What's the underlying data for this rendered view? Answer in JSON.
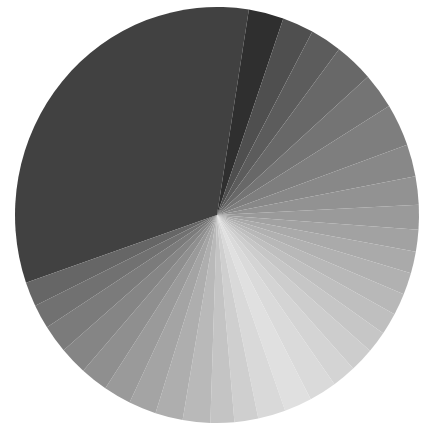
{
  "chart_data": {
    "type": "pie",
    "title": "",
    "legend": "none",
    "start_angle_deg": 251,
    "direction": "clockwise",
    "center": [
      217,
      215
    ],
    "radius": [
      202,
      208
    ],
    "slices": [
      {
        "label": "",
        "value": 32.8,
        "color": "#414141"
      },
      {
        "label": "",
        "value": 2.8,
        "color": "#2f2f2f"
      },
      {
        "label": "",
        "value": 2.5,
        "color": "#4f4f4f"
      },
      {
        "label": "",
        "value": 2.5,
        "color": "#5c5c5c"
      },
      {
        "label": "",
        "value": 3.1,
        "color": "#686868"
      },
      {
        "label": "",
        "value": 2.8,
        "color": "#747474"
      },
      {
        "label": "",
        "value": 3.3,
        "color": "#7e7e7e"
      },
      {
        "label": "",
        "value": 2.5,
        "color": "#888888"
      },
      {
        "label": "",
        "value": 2.2,
        "color": "#929292"
      },
      {
        "label": "",
        "value": 1.9,
        "color": "#9a9a9a"
      },
      {
        "label": "",
        "value": 1.7,
        "color": "#a2a2a2"
      },
      {
        "label": "",
        "value": 1.7,
        "color": "#aaaaaa"
      },
      {
        "label": "",
        "value": 1.7,
        "color": "#b1b1b1"
      },
      {
        "label": "",
        "value": 1.7,
        "color": "#b8b8b8"
      },
      {
        "label": "",
        "value": 1.7,
        "color": "#bfbfbf"
      },
      {
        "label": "",
        "value": 1.7,
        "color": "#c6c6c6"
      },
      {
        "label": "",
        "value": 1.9,
        "color": "#cdcdcd"
      },
      {
        "label": "",
        "value": 1.9,
        "color": "#d4d4d4"
      },
      {
        "label": "",
        "value": 2.2,
        "color": "#dadada"
      },
      {
        "label": "",
        "value": 2.2,
        "color": "#e0e0e0"
      },
      {
        "label": "",
        "value": 2.2,
        "color": "#d9d9d9"
      },
      {
        "label": "",
        "value": 1.9,
        "color": "#cfcfcf"
      },
      {
        "label": "",
        "value": 1.9,
        "color": "#c4c4c4"
      },
      {
        "label": "",
        "value": 2.2,
        "color": "#b9b9b9"
      },
      {
        "label": "",
        "value": 2.2,
        "color": "#aeaeae"
      },
      {
        "label": "",
        "value": 2.2,
        "color": "#a4a4a4"
      },
      {
        "label": "",
        "value": 2.2,
        "color": "#9a9a9a"
      },
      {
        "label": "",
        "value": 2.2,
        "color": "#8f8f8f"
      },
      {
        "label": "",
        "value": 2.2,
        "color": "#858585"
      },
      {
        "label": "",
        "value": 2.2,
        "color": "#7b7b7b"
      },
      {
        "label": "",
        "value": 1.9,
        "color": "#717171"
      },
      {
        "label": "",
        "value": 1.9,
        "color": "#666666"
      }
    ]
  }
}
